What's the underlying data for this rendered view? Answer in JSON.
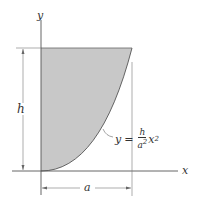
{
  "diagram": {
    "axes": {
      "x_label": "x",
      "y_label": "y"
    },
    "dimensions": {
      "height_label": "h",
      "width_label": "a"
    },
    "curve": {
      "equation_lhs": "y",
      "equals": "=",
      "numerator": "h",
      "denominator": "a",
      "denominator_exp": "2",
      "variable": "x",
      "variable_exp": "2"
    },
    "colors": {
      "fill": "#c8c8c8",
      "line": "#555555"
    }
  }
}
